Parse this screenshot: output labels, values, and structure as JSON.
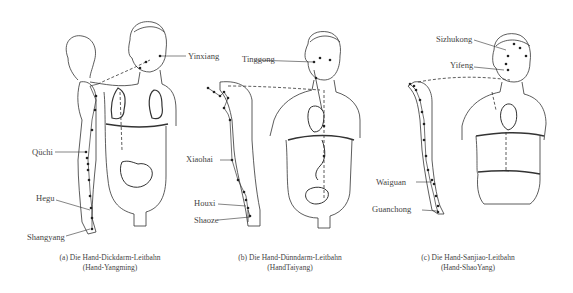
{
  "figures": [
    {
      "id": "a",
      "caption_line1": "(a) Die Hand-Dickdarm-Leitbahn",
      "caption_line2": "(Hand-Yangming)",
      "points": [
        "Yinxiang",
        "Qüchi",
        "Hegu",
        "Shangyang"
      ]
    },
    {
      "id": "b",
      "caption_line1": "(b) Die Hand-Dünndarm-Leitbahn",
      "caption_line2": "(HandTaiyang)",
      "points": [
        "Tinggong",
        "Xiaohai",
        "Houxi",
        "Shaoze"
      ]
    },
    {
      "id": "c",
      "caption_line1": "(c) Die Hand-Sanjiao-Leitbahn",
      "caption_line2": "(Hand-ShaoYang)",
      "points": [
        "Sizhukong",
        "Yifeng",
        "Waiguan",
        "Guanchong"
      ]
    }
  ],
  "colors": {
    "line": "#333333",
    "background": "#ffffff",
    "text": "#444444"
  }
}
